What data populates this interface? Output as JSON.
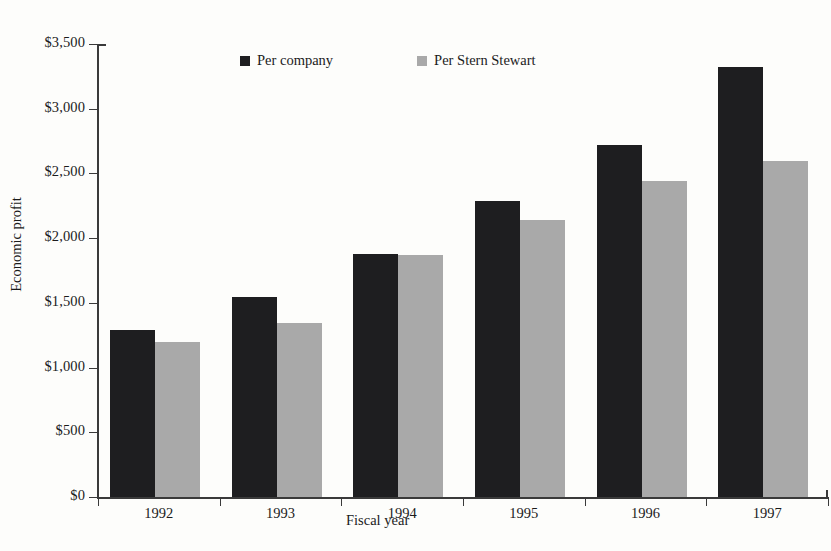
{
  "chart_data": {
    "type": "bar",
    "title": "",
    "xlabel": "Fiscal year",
    "ylabel": "Economic profit",
    "categories": [
      "1992",
      "1993",
      "1994",
      "1995",
      "1996",
      "1997"
    ],
    "series": [
      {
        "name": "Per company",
        "color": "#1e1e20",
        "values": [
          1290,
          1545,
          1880,
          2290,
          2720,
          3320
        ]
      },
      {
        "name": "Per Stern Stewart",
        "color": "#a9a9a9",
        "values": [
          1195,
          1345,
          1870,
          2140,
          2440,
          2600
        ]
      }
    ],
    "ylim": [
      0,
      3500
    ],
    "ytick_values": [
      0,
      500,
      1000,
      1500,
      2000,
      2500,
      3000,
      3500
    ],
    "ytick_labels": [
      "$0",
      "$500",
      "$1,000",
      "$1,500",
      "$2,000",
      "$2,500",
      "$3,000",
      "$3,500"
    ],
    "grid": false,
    "legend_position": "top-center"
  }
}
